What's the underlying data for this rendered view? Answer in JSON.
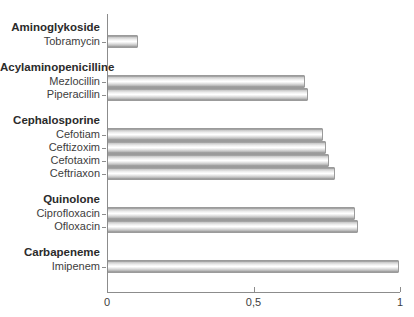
{
  "chart_data": {
    "type": "bar",
    "orientation": "horizontal",
    "title": "",
    "xlabel": "",
    "ylabel": "",
    "xlim": [
      0,
      1
    ],
    "grid": false,
    "legend": false,
    "x_ticks": [
      {
        "label": "0",
        "value": 0
      },
      {
        "label": "0,5",
        "value": 0.5
      },
      {
        "label": "1",
        "value": 1
      }
    ],
    "groups": [
      {
        "header": "Aminoglykoside",
        "items": [
          {
            "label": "Tobramycin",
            "value": 0.1
          }
        ]
      },
      {
        "header": "Acylaminopenicilline",
        "items": [
          {
            "label": "Mezlocillin",
            "value": 0.67
          },
          {
            "label": "Piperacillin",
            "value": 0.68
          }
        ]
      },
      {
        "header": "Cephalosporine",
        "items": [
          {
            "label": "Cefotiam",
            "value": 0.73
          },
          {
            "label": "Ceftizoxim",
            "value": 0.74
          },
          {
            "label": "Cefotaxim",
            "value": 0.75
          },
          {
            "label": "Ceftriaxon",
            "value": 0.77
          }
        ]
      },
      {
        "header": "Quinolone",
        "items": [
          {
            "label": "Ciprofloxacin",
            "value": 0.84
          },
          {
            "label": "Ofloxacin",
            "value": 0.85
          }
        ]
      },
      {
        "header": "Carbapeneme",
        "items": [
          {
            "label": "Imipenem",
            "value": 0.99
          }
        ]
      }
    ],
    "colors": {
      "bar_fill_top": "#8f8f8f",
      "bar_fill_highlight": "#ffffff",
      "bar_border": "#9b9b9b",
      "axis": "#8c8c8c",
      "text": "#3d3d3d",
      "header_text": "#2b2b2b",
      "background": "#ffffff"
    }
  }
}
